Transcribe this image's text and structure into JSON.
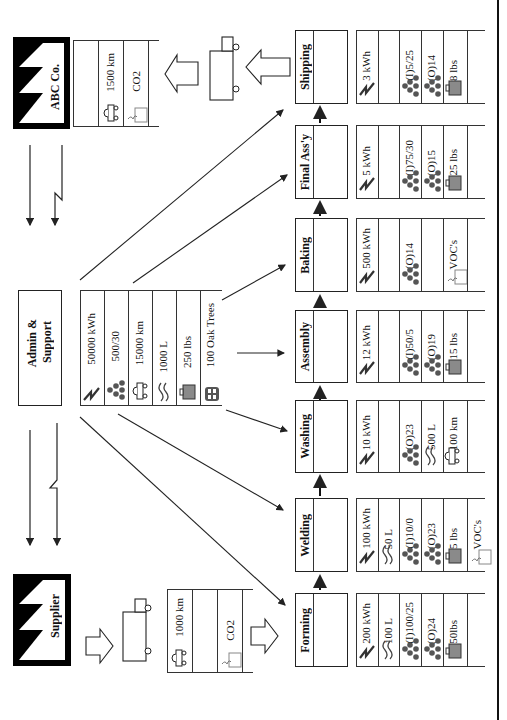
{
  "diagram": {
    "orientation": "rotated-90-ccw",
    "entities": {
      "customer": {
        "label": "ABC Co.",
        "icon": "factory-icon"
      },
      "supplier": {
        "label": "Supplier",
        "icon": "factory-icon"
      },
      "admin": {
        "label_line1": "Admin &",
        "label_line2": "Support"
      }
    },
    "customer_transport": {
      "distance": "1500 km",
      "emission": "CO2"
    },
    "supplier_transport": {
      "distance": "1000 km",
      "emission": "CO2"
    },
    "admin_resources": [
      {
        "icon": "electricity-icon",
        "value": "50000 kWh"
      },
      {
        "icon": "solid-waste-dots-icon",
        "value": "500/30"
      },
      {
        "icon": "vehicle-icon",
        "value": "15000 km"
      },
      {
        "icon": "water-icon",
        "value": "1000 L"
      },
      {
        "icon": "trash-bin-icon",
        "value": "250 lbs"
      },
      {
        "icon": "wood-icon",
        "value": "100 Oak Trees"
      }
    ],
    "processes": [
      {
        "name": "Forming",
        "metrics": [
          {
            "icon": "electricity-icon",
            "value": "200 kWh"
          },
          {
            "icon": "water-icon",
            "value": "100 L"
          },
          {
            "icon": "solid-waste-dots-icon",
            "value": "(I)100/25"
          },
          {
            "icon": "solid-waste-dots-icon",
            "value": "(O)24"
          },
          {
            "icon": "trash-bin-icon",
            "value": "50lbs"
          },
          {
            "icon": "",
            "value": ""
          }
        ]
      },
      {
        "name": "Welding",
        "metrics": [
          {
            "icon": "electricity-icon",
            "value": "100 kWh"
          },
          {
            "icon": "water-icon",
            "value": "50 L"
          },
          {
            "icon": "solid-waste-dots-icon",
            "value": "(I)10/0"
          },
          {
            "icon": "solid-waste-dots-icon",
            "value": "(O)23"
          },
          {
            "icon": "trash-bin-icon",
            "value": "5 lbs"
          },
          {
            "icon": "emission-icon",
            "value": "VOC's"
          }
        ]
      },
      {
        "name": "Washing",
        "metrics": [
          {
            "icon": "electricity-icon",
            "value": "10 kWh"
          },
          {
            "icon": "",
            "value": ""
          },
          {
            "icon": "solid-waste-dots-icon",
            "value": "(O)23"
          },
          {
            "icon": "water-icon",
            "value": "500 L"
          },
          {
            "icon": "vehicle-icon",
            "value": "100 km"
          },
          {
            "icon": "",
            "value": ""
          }
        ]
      },
      {
        "name": "Assembly",
        "metrics": [
          {
            "icon": "electricity-icon",
            "value": "12 kWh"
          },
          {
            "icon": "",
            "value": ""
          },
          {
            "icon": "solid-waste-dots-icon",
            "value": "(I)50/5"
          },
          {
            "icon": "solid-waste-dots-icon",
            "value": "(O)19"
          },
          {
            "icon": "trash-bin-icon",
            "value": "15 lbs"
          },
          {
            "icon": "",
            "value": ""
          }
        ]
      },
      {
        "name": "Baking",
        "metrics": [
          {
            "icon": "electricity-icon",
            "value": "500 kWh"
          },
          {
            "icon": "",
            "value": ""
          },
          {
            "icon": "solid-waste-dots-icon",
            "value": "(O)14"
          },
          {
            "icon": "",
            "value": ""
          },
          {
            "icon": "emission-icon",
            "value": "VOC's"
          },
          {
            "icon": "",
            "value": ""
          }
        ]
      },
      {
        "name": "Final Ass'y",
        "metrics": [
          {
            "icon": "electricity-icon",
            "value": "5 kWh"
          },
          {
            "icon": "",
            "value": ""
          },
          {
            "icon": "solid-waste-dots-icon",
            "value": "(I)75/30"
          },
          {
            "icon": "solid-waste-dots-icon",
            "value": "(O)15"
          },
          {
            "icon": "trash-bin-icon",
            "value": "25 lbs"
          },
          {
            "icon": "",
            "value": ""
          }
        ]
      },
      {
        "name": "Shipping",
        "metrics": [
          {
            "icon": "electricity-icon",
            "value": "3 kWh"
          },
          {
            "icon": "",
            "value": ""
          },
          {
            "icon": "solid-waste-dots-icon",
            "value": "(I)5/25"
          },
          {
            "icon": "solid-waste-dots-icon",
            "value": "(O)14"
          },
          {
            "icon": "trash-bin-icon",
            "value": "8 lbs"
          },
          {
            "icon": "",
            "value": ""
          }
        ]
      }
    ],
    "colors": {
      "line": "#222222",
      "fill_gray": "#8a8a8a",
      "dot": "#555555"
    }
  }
}
